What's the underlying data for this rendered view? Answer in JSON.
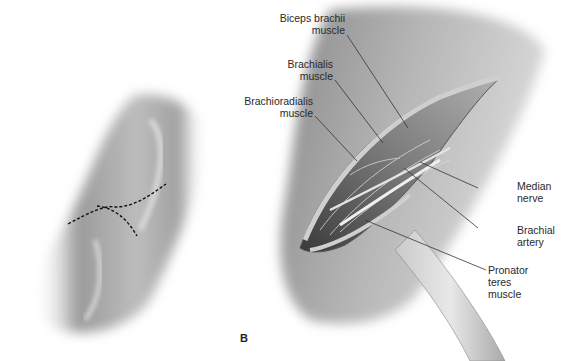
{
  "figure": {
    "panel_letter": "B",
    "panels": [
      {
        "name": "panel-a",
        "description": "Forearm with dashed incision line"
      },
      {
        "name": "panel-b",
        "description": "Open surgical exposure of antecubital fossa with retractor"
      }
    ]
  },
  "labels": {
    "biceps": {
      "line1": "Biceps brachii",
      "line2": "muscle"
    },
    "brachialis": {
      "line1": "Brachialis",
      "line2": "muscle"
    },
    "brachioradialis": {
      "line1": "Brachioradialis",
      "line2": "muscle"
    },
    "median_nerve": {
      "line1": "Median",
      "line2": "nerve"
    },
    "brachial_artery": {
      "line1": "Brachial",
      "line2": "artery"
    },
    "pronator_teres": {
      "line1": "Pronator",
      "line2": "teres",
      "line3": "muscle"
    }
  },
  "colors": {
    "skin_dark": "#8c8c8c",
    "skin_light": "#e6e6e6",
    "leader_line": "#333333",
    "text": "#2a2a2a"
  }
}
